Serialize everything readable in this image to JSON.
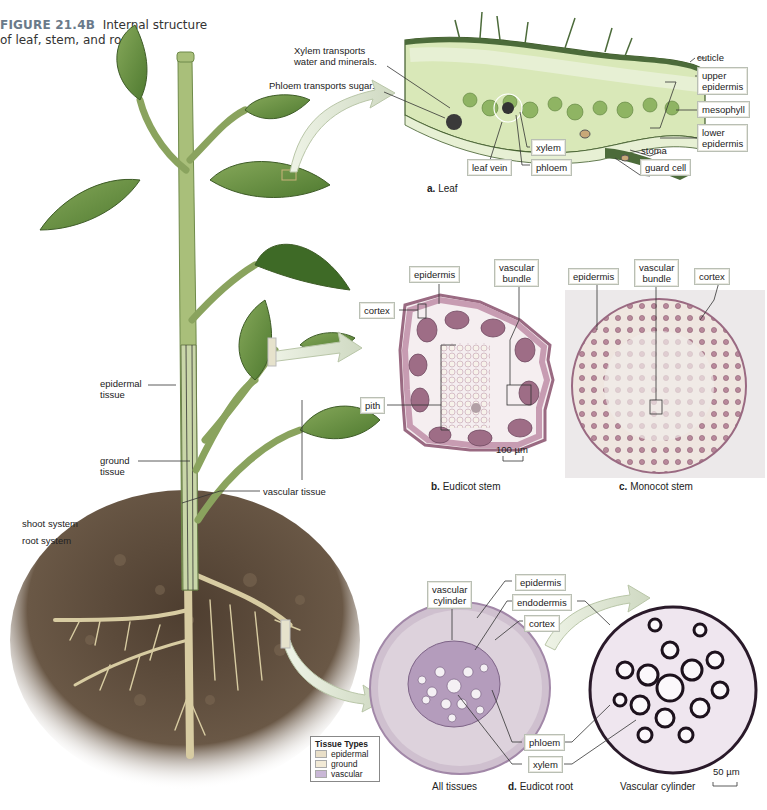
{
  "figure": {
    "number": "FIGURE 21.4B",
    "title_line1": "Internal structure",
    "title_line2": "of leaf, stem, and root."
  },
  "plant": {
    "labels": {
      "epidermal_tissue_1": "epidermal",
      "epidermal_tissue_2": "tissue",
      "ground_tissue_1": "ground",
      "ground_tissue_2": "tissue",
      "vascular_tissue": "vascular tissue",
      "shoot_system": "shoot system",
      "root_system": "root system"
    },
    "colors": {
      "stem": "#a9bf7a",
      "leaf": "#5f8a3a",
      "leaf_dark": "#3e6a26",
      "soil": "#5b4a3a",
      "root": "#d9cfa6"
    }
  },
  "leaf_panel": {
    "caption_letter": "a.",
    "caption_text": "Leaf",
    "annotations": {
      "xylem_transports_1": "Xylem transports",
      "xylem_transports_2": "water and minerals.",
      "phloem_transports": "Phloem transports sugar.",
      "cuticle": "cuticle",
      "upper_epidermis_1": "upper",
      "upper_epidermis_2": "epidermis",
      "mesophyll": "mesophyll",
      "lower_epidermis_1": "lower",
      "lower_epidermis_2": "epidermis",
      "stoma": "stoma",
      "guard_cell": "guard cell",
      "xylem": "xylem",
      "phloem": "phloem",
      "leaf_vein": "leaf vein"
    }
  },
  "eudicot_stem": {
    "caption_letter": "b.",
    "caption_text": "Eudicot stem",
    "labels": {
      "epidermis": "epidermis",
      "vascular_bundle_1": "vascular",
      "vascular_bundle_2": "bundle",
      "cortex": "cortex",
      "pith": "pith"
    },
    "scale_bar": "100 µm"
  },
  "monocot_stem": {
    "caption_letter": "c.",
    "caption_text": "Monocot stem",
    "labels": {
      "epidermis": "epidermis",
      "vascular_bundle_1": "vascular",
      "vascular_bundle_2": "bundle",
      "cortex": "cortex"
    }
  },
  "eudicot_root": {
    "caption_letter": "d.",
    "caption_text": "Eudicot root",
    "left_caption": "All tissues",
    "right_caption": "Vascular cylinder",
    "labels": {
      "vascular_cylinder_1": "vascular",
      "vascular_cylinder_2": "cylinder",
      "epidermis": "epidermis",
      "endodermis": "endodermis",
      "cortex": "cortex",
      "phloem": "phloem",
      "xylem": "xylem"
    },
    "scale_bar": "50 µm"
  },
  "legend": {
    "title": "Tissue Types",
    "items": [
      {
        "label": "epidermal",
        "color": "#e9dfc8"
      },
      {
        "label": "ground",
        "color": "#f2ead6"
      },
      {
        "label": "vascular",
        "color": "#c9b7d6"
      }
    ]
  }
}
